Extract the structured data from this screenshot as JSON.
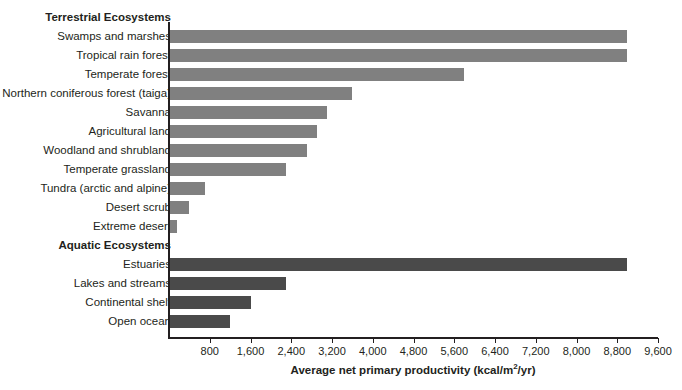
{
  "chart_data": {
    "type": "bar",
    "orientation": "horizontal",
    "title": "",
    "xlabel": "Average net primary productivity (kcal/m²/yr)",
    "ylabel": "",
    "xlim": [
      0,
      9600
    ],
    "xticks": [
      800,
      1600,
      2400,
      3200,
      4000,
      4800,
      5600,
      6400,
      7200,
      8000,
      8800,
      9600
    ],
    "xtick_labels": [
      "800",
      "1,600",
      "2,400",
      "3,200",
      "4,000",
      "4,800",
      "5,600",
      "6,400",
      "7,200",
      "8,000",
      "8,800",
      "9,600"
    ],
    "grid": false,
    "legend": "none",
    "groups": [
      {
        "name": "Terrestrial Ecosystems",
        "color": "#808080",
        "categories": [
          "Swamps and marshes",
          "Tropical rain forest",
          "Temperate forest",
          "Northern coniferous forest (taiga)",
          "Savanna",
          "Agricultural land",
          "Woodland and shrubland",
          "Temperate grassland",
          "Tundra (arctic and alpine)",
          "Desert scrub",
          "Extreme desert"
        ],
        "values": [
          9000,
          9000,
          5800,
          3600,
          3100,
          2900,
          2700,
          2300,
          700,
          400,
          150
        ]
      },
      {
        "name": "Aquatic Ecosystems",
        "color": "#4a4a4a",
        "categories": [
          "Estuaries",
          "Lakes and streams",
          "Continental shelf",
          "Open ocean"
        ],
        "values": [
          9000,
          2300,
          1600,
          1200
        ]
      }
    ]
  },
  "rows": [
    {
      "label": "Terrestrial Ecosystems",
      "type": "group",
      "value": null,
      "series": "terrestrial"
    },
    {
      "label": "Swamps and marshes",
      "type": "bar",
      "value": 9000,
      "series": "terrestrial"
    },
    {
      "label": "Tropical rain forest",
      "type": "bar",
      "value": 9000,
      "series": "terrestrial"
    },
    {
      "label": "Temperate forest",
      "type": "bar",
      "value": 5800,
      "series": "terrestrial"
    },
    {
      "label": "Northern coniferous forest (taiga)",
      "type": "bar",
      "value": 3600,
      "series": "terrestrial"
    },
    {
      "label": "Savanna",
      "type": "bar",
      "value": 3100,
      "series": "terrestrial"
    },
    {
      "label": "Agricultural land",
      "type": "bar",
      "value": 2900,
      "series": "terrestrial"
    },
    {
      "label": "Woodland and shrubland",
      "type": "bar",
      "value": 2700,
      "series": "terrestrial"
    },
    {
      "label": "Temperate grassland",
      "type": "bar",
      "value": 2300,
      "series": "terrestrial"
    },
    {
      "label": "Tundra (arctic and alpine)",
      "type": "bar",
      "value": 700,
      "series": "terrestrial"
    },
    {
      "label": "Desert scrub",
      "type": "bar",
      "value": 400,
      "series": "terrestrial"
    },
    {
      "label": "Extreme desert",
      "type": "bar",
      "value": 150,
      "series": "terrestrial"
    },
    {
      "label": "Aquatic Ecosystems",
      "type": "group",
      "value": null,
      "series": "aquatic"
    },
    {
      "label": "Estuaries",
      "type": "bar",
      "value": 9000,
      "series": "aquatic"
    },
    {
      "label": "Lakes and streams",
      "type": "bar",
      "value": 2300,
      "series": "aquatic"
    },
    {
      "label": "Continental shelf",
      "type": "bar",
      "value": 1600,
      "series": "aquatic"
    },
    {
      "label": "Open ocean",
      "type": "bar",
      "value": 1200,
      "series": "aquatic"
    }
  ],
  "axis": {
    "title_main": "Average net primary productivity (kcal/m",
    "title_sup": "2",
    "title_tail": "/yr)"
  },
  "colors": {
    "terrestrial": "#808080",
    "aquatic": "#4a4a4a",
    "axis": "#231f20",
    "background": "#ffffff"
  }
}
